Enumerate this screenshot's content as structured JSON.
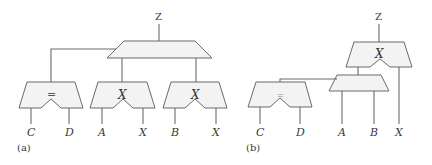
{
  "panel_a": {
    "caption": "(a)",
    "output_label": "Z",
    "top_block": {
      "label": ""
    },
    "blocks": [
      {
        "label": "=",
        "inputs": [
          "C",
          "D"
        ]
      },
      {
        "label": "X",
        "inputs": [
          "A",
          "X"
        ]
      },
      {
        "label": "X",
        "inputs": [
          "B",
          "X"
        ]
      }
    ]
  },
  "panel_b": {
    "caption": "(b)",
    "output_label": "Z",
    "top_block": {
      "label": "X",
      "right_input": "X"
    },
    "middle_block": {
      "label": "",
      "inputs": [
        "A",
        "B"
      ]
    },
    "compare_block": {
      "label": "=",
      "inputs": [
        "C",
        "D"
      ]
    }
  },
  "colors": {
    "fill": "#f3f3f3",
    "stroke": "#6a6a6a",
    "text": "#3a3a3a"
  }
}
